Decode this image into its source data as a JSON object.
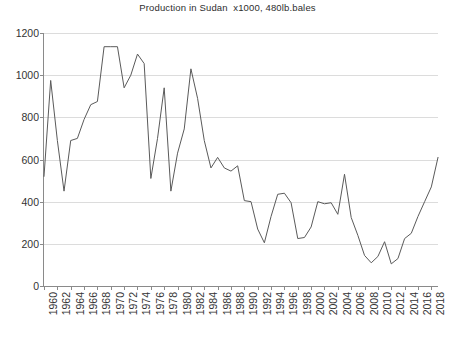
{
  "chart_data": {
    "type": "line",
    "title": "Production in Sudan  x1000, 480lb.bales",
    "xlabel": "",
    "ylabel": "",
    "xlim": [
      1960,
      2019
    ],
    "ylim": [
      0,
      1200
    ],
    "ytick_step": 200,
    "xtick_step": 2,
    "grid": true,
    "legend": "none",
    "line_color": "#5a5a5a",
    "grid_color": "#dcdcdc",
    "axis_color": "#8a8a8a",
    "ytick_labels": [
      "0",
      "200",
      "400",
      "600",
      "800",
      "1000",
      "1200"
    ],
    "ytick_values": [
      0,
      200,
      400,
      600,
      800,
      1000,
      1200
    ],
    "xtick_labels": [
      "1960",
      "1962",
      "1964",
      "1966",
      "1968",
      "1970",
      "1972",
      "1974",
      "1976",
      "1978",
      "1980",
      "1982",
      "1984",
      "1986",
      "1988",
      "1990",
      "1992",
      "1994",
      "1996",
      "1998",
      "2000",
      "2002",
      "2004",
      "2006",
      "2008",
      "2010",
      "2012",
      "2014",
      "2016",
      "2018"
    ],
    "xtick_values": [
      1960,
      1962,
      1964,
      1966,
      1968,
      1970,
      1972,
      1974,
      1976,
      1978,
      1980,
      1982,
      1984,
      1986,
      1988,
      1990,
      1992,
      1994,
      1996,
      1998,
      2000,
      2002,
      2004,
      2006,
      2008,
      2010,
      2012,
      2014,
      2016,
      2018
    ],
    "x": [
      1960,
      1961,
      1962,
      1963,
      1964,
      1965,
      1966,
      1967,
      1968,
      1969,
      1970,
      1971,
      1972,
      1973,
      1974,
      1975,
      1976,
      1977,
      1978,
      1979,
      1980,
      1981,
      1982,
      1983,
      1984,
      1985,
      1986,
      1987,
      1988,
      1989,
      1990,
      1991,
      1992,
      1993,
      1994,
      1995,
      1996,
      1997,
      1998,
      1999,
      2000,
      2001,
      2002,
      2003,
      2004,
      2005,
      2006,
      2007,
      2008,
      2009,
      2010,
      2011,
      2012,
      2013,
      2014,
      2015,
      2016,
      2017,
      2018,
      2019
    ],
    "values": [
      520,
      975,
      690,
      450,
      690,
      700,
      790,
      860,
      875,
      1135,
      1135,
      1135,
      940,
      1000,
      1100,
      1055,
      510,
      700,
      940,
      450,
      630,
      745,
      1030,
      890,
      690,
      560,
      610,
      560,
      545,
      570,
      405,
      400,
      270,
      205,
      330,
      435,
      440,
      395,
      225,
      230,
      280,
      400,
      390,
      395,
      340,
      530,
      325,
      240,
      145,
      110,
      140,
      210,
      105,
      130,
      225,
      250,
      330,
      400,
      470,
      610
    ],
    "series": [
      {
        "name": "Production in Sudan",
        "values": [
          520,
          975,
          690,
          450,
          690,
          700,
          790,
          860,
          875,
          1135,
          1135,
          1135,
          940,
          1000,
          1100,
          1055,
          510,
          700,
          940,
          450,
          630,
          745,
          1030,
          890,
          690,
          560,
          610,
          560,
          545,
          570,
          405,
          400,
          270,
          205,
          330,
          435,
          440,
          395,
          225,
          230,
          280,
          400,
          390,
          395,
          340,
          530,
          325,
          240,
          145,
          110,
          140,
          210,
          105,
          130,
          225,
          250,
          330,
          400,
          470,
          610
        ]
      }
    ]
  },
  "footnote": {
    "text": ""
  }
}
